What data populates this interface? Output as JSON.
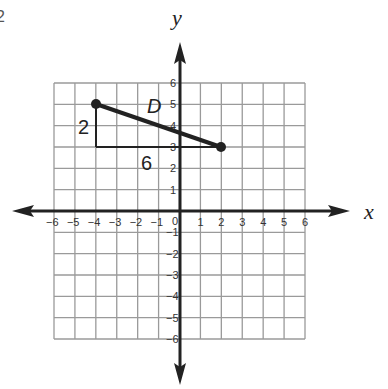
{
  "corner_fragment": "2",
  "axes": {
    "x_label": "x",
    "y_label": "y",
    "x_ticks": [
      "−6",
      "−5",
      "−4",
      "−3",
      "−2",
      "−1",
      "1",
      "2",
      "3",
      "4",
      "5",
      "6"
    ],
    "y_ticks_pos": [
      "6",
      "5",
      "4",
      "3",
      "2",
      "1"
    ],
    "y_ticks_neg": [
      "−1",
      "−2",
      "−3",
      "−4",
      "−5",
      "−6"
    ],
    "origin_label": "0",
    "range": {
      "xmin": -6,
      "xmax": 6,
      "ymin": -6,
      "ymax": 6
    }
  },
  "segment": {
    "label": "D",
    "start": {
      "x": -4,
      "y": 5
    },
    "end": {
      "x": 2,
      "y": 3
    }
  },
  "slope_triangle": {
    "rise_label": "2",
    "run_label": "6"
  },
  "colors": {
    "grid": "#9a9a9a",
    "axis": "#222222",
    "segment": "#222222"
  }
}
